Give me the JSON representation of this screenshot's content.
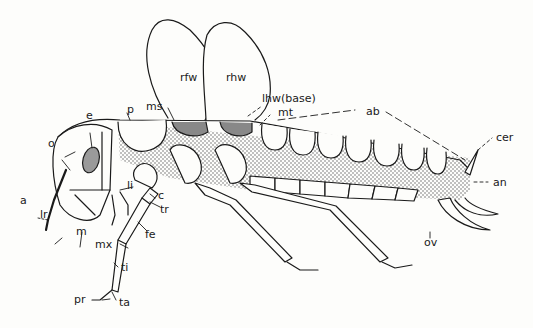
{
  "figure": {
    "colors": {
      "ink": "#1a1a1a",
      "stipple": "#c8c8c8",
      "eye": "#9a9a9a",
      "paper": "#fdfdfb"
    }
  },
  "labels": {
    "rfw": "rfw",
    "rhw": "rhw",
    "lhw": "lhw(base)",
    "ms": "ms",
    "mt": "mt",
    "p": "p",
    "e": "e",
    "o": "o",
    "ab": "ab",
    "cer": "cer",
    "an": "an",
    "a": "a",
    "lr": "lr",
    "m": "m",
    "li": "li",
    "c": "c",
    "tr": "tr",
    "fe": "fe",
    "mx": "mx",
    "ti": "ti",
    "pr": "pr",
    "ta": "ta",
    "ov": "ov"
  }
}
